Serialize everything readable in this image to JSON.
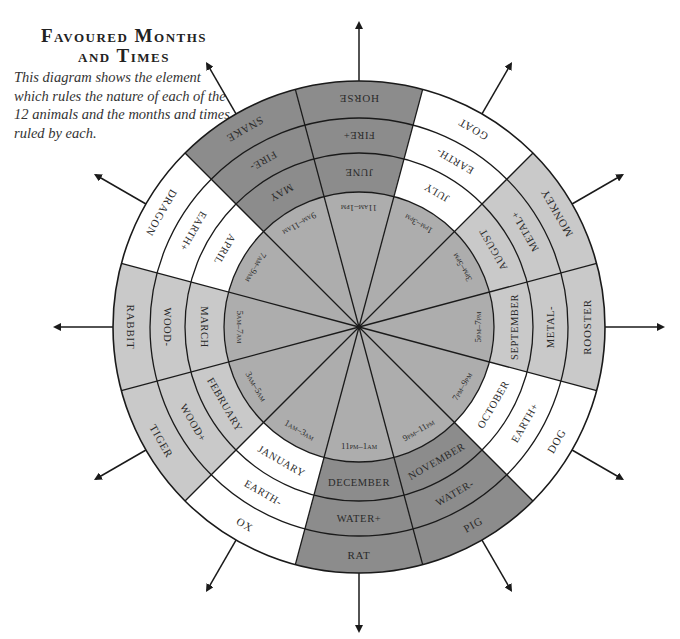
{
  "header": {
    "title_line1": "Favoured Months",
    "title_line2": "and Times",
    "caption": "This diagram shows the element which rules the nature of each of the 12 animals and the months and times ruled by each."
  },
  "colors": {
    "fire": "#8c8c8c",
    "water": "#8c8c8c",
    "earth": "#ffffff",
    "wood": "#c9c9c9",
    "metal": "#c9c9c9",
    "hub": "#adadad",
    "line": "#1a1a1a"
  },
  "wheel": {
    "sectors": [
      {
        "animal": "Rat",
        "element": "Water+",
        "element_type": "water",
        "month": "December",
        "time": "11pm–1am"
      },
      {
        "animal": "Ox",
        "element": "Earth-",
        "element_type": "earth",
        "month": "January",
        "time": "1am–3am"
      },
      {
        "animal": "Tiger",
        "element": "Wood+",
        "element_type": "wood",
        "month": "February",
        "time": "3am–5am"
      },
      {
        "animal": "Rabbit",
        "element": "Wood-",
        "element_type": "wood",
        "month": "March",
        "time": "5am–7am"
      },
      {
        "animal": "Dragon",
        "element": "Earth+",
        "element_type": "earth",
        "month": "April",
        "time": "7am–9am"
      },
      {
        "animal": "Snake",
        "element": "Fire-",
        "element_type": "fire",
        "month": "May",
        "time": "9am–11am"
      },
      {
        "animal": "Horse",
        "element": "Fire+",
        "element_type": "fire",
        "month": "June",
        "time": "11am–1pm"
      },
      {
        "animal": "Goat",
        "element": "Earth-",
        "element_type": "earth",
        "month": "July",
        "time": "1pm–3pm"
      },
      {
        "animal": "Monkey",
        "element": "Metal+",
        "element_type": "metal",
        "month": "August",
        "time": "3pm–5pm"
      },
      {
        "animal": "Rooster",
        "element": "Metal-",
        "element_type": "metal",
        "month": "September",
        "time": "5pm–7pm"
      },
      {
        "animal": "Dog",
        "element": "Earth+",
        "element_type": "earth",
        "month": "October",
        "time": "7pm–9pm"
      },
      {
        "animal": "Pig",
        "element": "Water-",
        "element_type": "water",
        "month": "November",
        "time": "9pm–11pm"
      }
    ]
  }
}
